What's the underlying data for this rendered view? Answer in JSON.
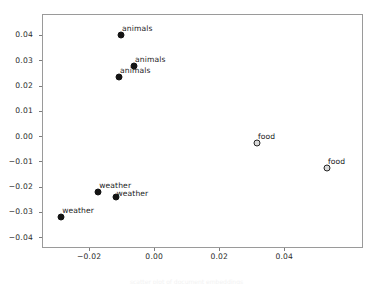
{
  "chart_data": {
    "type": "scatter",
    "title": "",
    "xlabel": "",
    "ylabel": "",
    "xlim": [
      -0.0345,
      0.0642
    ],
    "ylim": [
      -0.0443,
      0.0483
    ],
    "grid": false,
    "legend": null,
    "xticks": [
      -0.02,
      0.0,
      0.02,
      0.04
    ],
    "xticklabels": [
      "−0.02",
      "0.00",
      "0.02",
      "0.04"
    ],
    "yticks": [
      0.04,
      0.03,
      0.02,
      0.01,
      0.0,
      -0.01,
      -0.02,
      -0.03,
      -0.04
    ],
    "yticklabels": [
      "0.04",
      "0.03",
      "0.02",
      "0.01",
      "0.00",
      "−0.01",
      "−0.02",
      "−0.03",
      "−0.04"
    ],
    "points": [
      {
        "label": "animals",
        "x": -0.0105,
        "y": 0.0403,
        "marker": "filled",
        "label_dx": 1,
        "label_dy": -11
      },
      {
        "label": "animals",
        "x": -0.0065,
        "y": 0.0281,
        "marker": "filled",
        "label_dx": 1,
        "label_dy": -11
      },
      {
        "label": "animals",
        "x": -0.0111,
        "y": 0.0236,
        "marker": "filled",
        "label_dx": 1,
        "label_dy": -11
      },
      {
        "label": "food",
        "x": 0.0313,
        "y": -0.0022,
        "marker": "open",
        "label_dx": 1,
        "label_dy": -11
      },
      {
        "label": "food",
        "x": 0.0528,
        "y": -0.0124,
        "marker": "open",
        "label_dx": 1,
        "label_dy": -11
      },
      {
        "label": "weather",
        "x": -0.0175,
        "y": -0.0219,
        "marker": "filled",
        "label_dx": 1,
        "label_dy": -11
      },
      {
        "label": "weather",
        "x": -0.0122,
        "y": -0.0239,
        "marker": "filled",
        "label_dx": 1,
        "label_dy": -8
      },
      {
        "label": "weather",
        "x": -0.0289,
        "y": -0.0316,
        "marker": "filled",
        "label_dx": 1,
        "label_dy": -11
      }
    ]
  },
  "caption": {
    "text": "scatter plot of document embeddings"
  }
}
